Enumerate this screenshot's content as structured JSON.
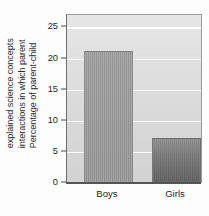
{
  "chart_data": {
    "type": "bar",
    "title": "",
    "xlabel": "",
    "ylabel": "Percentage of parent-child interactions in which parent explained science concepts",
    "ylabel_lines": [
      "Percentage of parent-child",
      "interactions in which parent",
      "explained science concepts"
    ],
    "categories": [
      "Boys",
      "Girls"
    ],
    "values": [
      21.2,
      7.2
    ],
    "ylim": [
      0,
      27
    ],
    "yticks": [
      0,
      5,
      10,
      15,
      20,
      25
    ],
    "ytick_labels": [
      "0",
      "5",
      "10",
      "15",
      "20",
      "25"
    ],
    "grid": true,
    "grid_orientation": "horizontal",
    "legend": false,
    "legend_position": "none",
    "bar_colors": [
      "#9a9a9a",
      "#6f6f6f"
    ],
    "plot_background": "#dcdcdc",
    "gridline_color": "#fbfbfb",
    "axis_color": "#555555"
  },
  "axis": {
    "y_title_line_1": "Percentage of parent-child",
    "y_title_line_2": "interactions in which parent",
    "y_title_line_3": "explained science concepts"
  }
}
